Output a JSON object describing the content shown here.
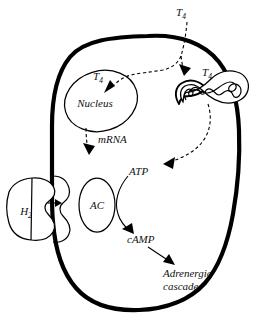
{
  "figure": {
    "background_color": "#ffffff",
    "ink_color": "#000000",
    "labels": {
      "t4_extracellular": {
        "base": "T",
        "sub": "4"
      },
      "t4_nucleus": {
        "base": "T",
        "sub": "4"
      },
      "t4_mitochondrion": {
        "base": "T",
        "sub": "4"
      },
      "nucleus": "Nucleus",
      "mrna": "mRNA",
      "atp": "ATP",
      "camp": "cAMP",
      "adenylate_cyclase": "AC",
      "h2_receptor": {
        "base": "H",
        "sub": "2"
      },
      "adrenergic_cascade_line1": "Adrenergic",
      "adrenergic_cascade_line2": "cascade"
    },
    "elements": [
      {
        "name": "cell-membrane",
        "kind": "outline",
        "note": "thick rounded cell boundary with notch at left"
      },
      {
        "name": "nucleus",
        "kind": "ellipse",
        "note": "tilted ellipse upper-left inside cell"
      },
      {
        "name": "mitochondrion",
        "kind": "bean",
        "note": "comma-shaped double membrane with cristae"
      },
      {
        "name": "adenylate-cyclase",
        "kind": "ellipse",
        "note": "narrow vertical ellipse in membrane"
      },
      {
        "name": "h2-receptor",
        "kind": "bean",
        "note": "kidney shape outside cell with vertical divider"
      }
    ],
    "connectors": [
      {
        "name": "t4-into-cell",
        "style": "dashed",
        "from": "t4_extracellular",
        "to": "cell interior"
      },
      {
        "name": "t4-to-nucleus",
        "style": "dashed",
        "from": "t4_extracellular",
        "to": "t4_nucleus"
      },
      {
        "name": "t4-to-mitochondrion",
        "style": "dashed",
        "from": "t4_extracellular",
        "to": "t4_mitochondrion"
      },
      {
        "name": "nucleus-to-mrna",
        "style": "dashed",
        "from": "nucleus",
        "to": "mrna"
      },
      {
        "name": "mitochondrion-to-atp",
        "style": "dashed",
        "from": "mitochondrion",
        "to": "atp"
      },
      {
        "name": "atp-to-camp",
        "style": "solid",
        "from": "atp",
        "to": "camp"
      },
      {
        "name": "camp-to-cascade",
        "style": "solid",
        "from": "camp",
        "to": "adrenergic_cascade"
      },
      {
        "name": "h2-to-membrane",
        "style": "solid",
        "from": "h2_receptor",
        "to": "cell membrane"
      }
    ]
  }
}
